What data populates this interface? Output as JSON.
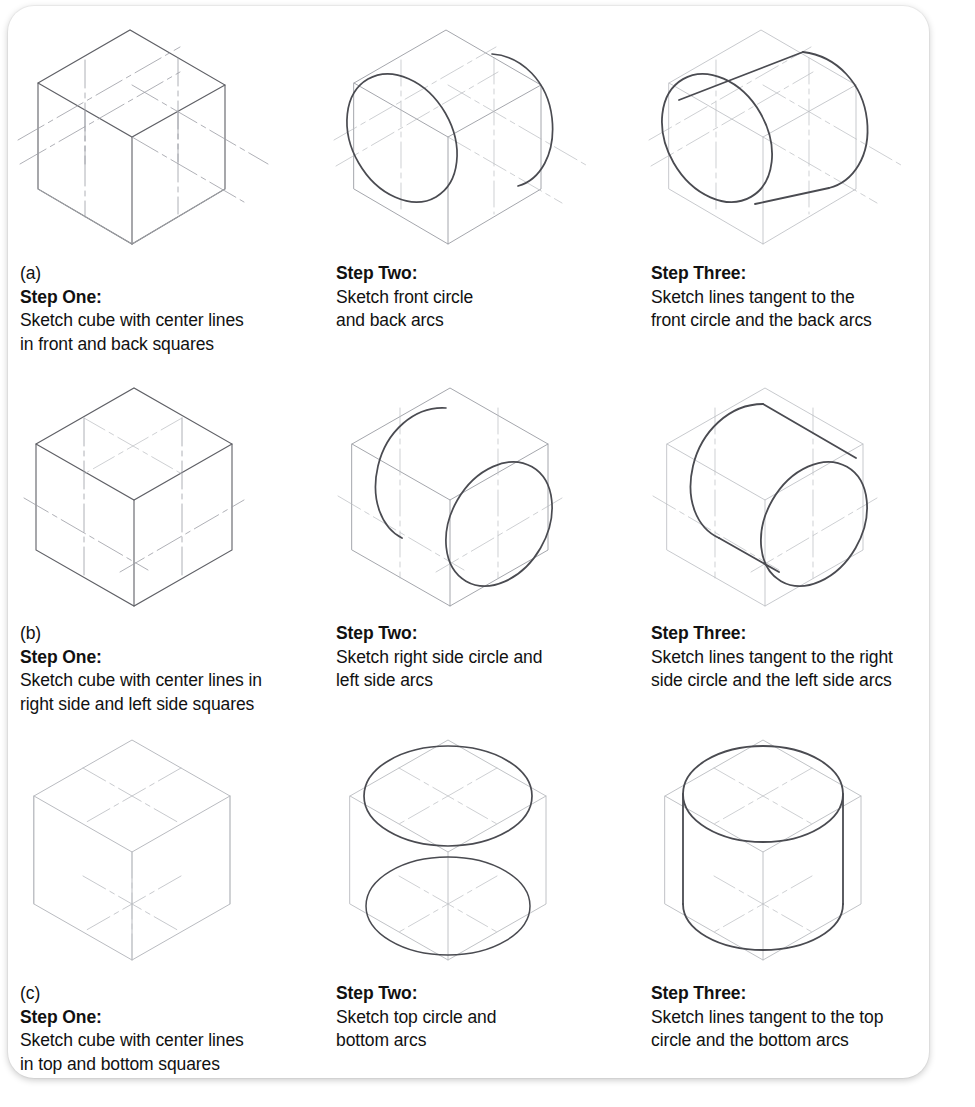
{
  "figure": {
    "background_color": "#ffffff",
    "panel_color": "#ffffff",
    "sketch_line_color": "#9a9ca3",
    "sketch_ink_color": "#4a4b51",
    "copyright": "© CENGAGE LEARNING 2013"
  },
  "rows": [
    {
      "label": "(a)",
      "orientation": "front-back",
      "cells": [
        {
          "step_title": "Step One:",
          "line1": "Sketch cube with center lines",
          "line2": "in front and back squares",
          "art": "isometric-cube-with-front-back-center-lines"
        },
        {
          "step_title": "Step Two:",
          "line1": "Sketch front circle",
          "line2": "and back arcs",
          "art": "isometric-cube-front-circle-back-arcs"
        },
        {
          "step_title": "Step Three:",
          "line1": "Sketch lines tangent to the",
          "line2": "front circle and the back arcs",
          "art": "isometric-cylinder-front-back"
        }
      ]
    },
    {
      "label": "(b)",
      "orientation": "right-left",
      "cells": [
        {
          "step_title": "Step One:",
          "line1": "Sketch cube with center lines in",
          "line2": "right side and left side squares",
          "art": "isometric-cube-with-side-center-lines"
        },
        {
          "step_title": "Step Two:",
          "line1": "Sketch right side circle and",
          "line2": "left side arcs",
          "art": "isometric-cube-right-circle-left-arcs"
        },
        {
          "step_title": "Step Three:",
          "line1": "Sketch lines tangent to the right",
          "line2": "side circle and the left side arcs",
          "art": "isometric-cylinder-right-left"
        }
      ]
    },
    {
      "label": "(c)",
      "orientation": "top-bottom",
      "cells": [
        {
          "step_title": "Step One:",
          "line1": "Sketch cube with center lines",
          "line2": "in top and bottom squares",
          "art": "isometric-cube-with-top-bottom-center-lines"
        },
        {
          "step_title": "Step Two:",
          "line1": "Sketch top circle and",
          "line2": "bottom arcs",
          "art": "isometric-cube-top-circle-bottom-arcs"
        },
        {
          "step_title": "Step Three:",
          "line1": "Sketch lines tangent to the top",
          "line2": "circle and the bottom arcs",
          "art": "isometric-cylinder-top-bottom"
        }
      ]
    }
  ]
}
